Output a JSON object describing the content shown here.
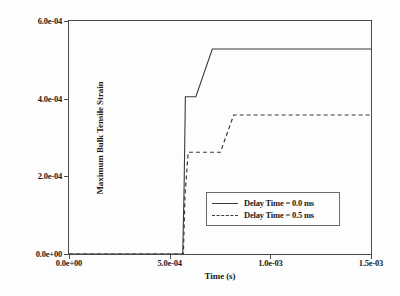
{
  "chart_data": {
    "type": "line",
    "title": "",
    "xlabel": "Time (s)",
    "ylabel": "Maximum Bulk Tensile Strain",
    "xlim": [
      0.0,
      0.0015
    ],
    "ylim": [
      0.0,
      0.0006
    ],
    "grid": false,
    "legend_position": "center",
    "xticks": [
      0.0,
      0.0005,
      0.001,
      0.0015
    ],
    "xtick_labels": [
      "0.0e+00",
      "5.0e-04",
      "1.0e-03",
      "1.5e-03"
    ],
    "yticks": [
      0.0,
      0.0002,
      0.0004,
      0.0006
    ],
    "ytick_labels": [
      "0.0e+00",
      "2.0e-04",
      "4.0e-04",
      "6.0e-04"
    ],
    "series": [
      {
        "name": "Delay Time = 0.0 ms",
        "style": "solid",
        "color": "#3a3a3a",
        "x": [
          0.0,
          0.000565,
          0.000572,
          0.000578,
          0.00063,
          0.000712,
          0.00095,
          0.0015
        ],
        "y": [
          0.0,
          0.0,
          0.00018,
          0.000405,
          0.000405,
          0.000528,
          0.000528,
          0.000528
        ]
      },
      {
        "name": "Delay Time = 0.5 ms",
        "style": "dashed",
        "color": "#3a3a3a",
        "x": [
          0.0,
          0.000568,
          0.000576,
          0.000592,
          0.000752,
          0.000818,
          0.00095,
          0.0015
        ],
        "y": [
          0.0,
          0.0,
          0.00015,
          0.000262,
          0.000262,
          0.000358,
          0.000358,
          0.000358
        ]
      }
    ]
  },
  "legend": {
    "entries": [
      {
        "label": "Delay Time = 0.0 ms",
        "style": "solid"
      },
      {
        "label": "Delay Time = 0.5 ms",
        "style": "dashed"
      }
    ]
  }
}
